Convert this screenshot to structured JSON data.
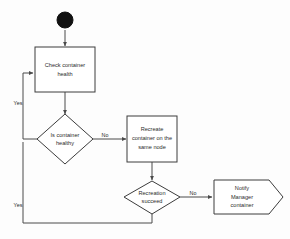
{
  "diagram": {
    "background_color": "#fdfdfd",
    "stroke_color": "#3c3c3c",
    "text_color": "#2b2b2b",
    "start_node": {
      "name": "start",
      "shape": "filled-circle"
    },
    "nodes": [
      {
        "id": "check_health",
        "shape": "rectangle",
        "lines": [
          "Check container",
          "health"
        ]
      },
      {
        "id": "is_healthy",
        "shape": "diamond",
        "lines": [
          "Is container",
          "healthy"
        ]
      },
      {
        "id": "recreate_container",
        "shape": "rectangle",
        "lines": [
          "Recreate",
          "container on the",
          "same node"
        ]
      },
      {
        "id": "recreation_succeed",
        "shape": "diamond",
        "lines": [
          "Recreation",
          "succeed"
        ]
      },
      {
        "id": "notify_manager",
        "shape": "pennant",
        "lines": [
          "Notify",
          "Manager",
          "container"
        ]
      }
    ],
    "edge_labels": {
      "healthy_yes": "Yes",
      "healthy_no": "No",
      "succeed_yes": "Yes",
      "succeed_no": "No"
    }
  }
}
